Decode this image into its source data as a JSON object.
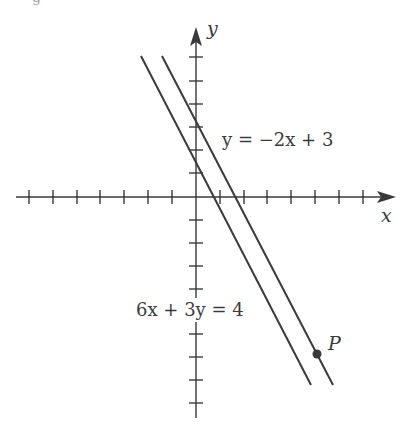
{
  "figure": {
    "caption_fragment": "g",
    "axes": {
      "x_label": "x",
      "y_label": "y",
      "origin_px": [
        196,
        197
      ],
      "unit_px": 23.6,
      "x_ticks": [
        -7,
        -6,
        -5,
        -4,
        -3,
        -2,
        -1,
        1,
        2,
        3,
        4,
        5,
        6,
        7
      ],
      "y_ticks": [
        6,
        5,
        4,
        3,
        2,
        1,
        -1,
        -2,
        -3,
        -4,
        -5,
        -6,
        -7,
        -8,
        -9
      ]
    },
    "lines": [
      {
        "name": "line-1",
        "equation": "y = −2x + 3",
        "slope": -2,
        "intercept": 3
      },
      {
        "name": "line-2",
        "equation": "6x + 3y = 4",
        "slope": -2,
        "intercept": 1.333
      }
    ],
    "labels": {
      "line1": "y = −2x + 3",
      "line2": "6x + 3y = 4",
      "point": "P"
    },
    "point": {
      "name": "P",
      "on_line": "y = −2x + 3"
    },
    "colors": {
      "ink": "#3a3a3a",
      "background": "#ffffff"
    }
  }
}
